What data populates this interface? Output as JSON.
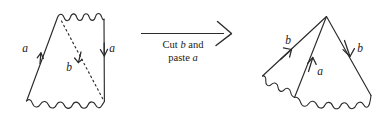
{
  "diagram": {
    "stroke_color": "#2b2b2b",
    "background_color": "#ffffff",
    "transform": {
      "caption_line_1_prefix": "Cut ",
      "caption_line_1_symbol": "b",
      "caption_line_1_suffix": " and",
      "caption_line_2_prefix": "paste ",
      "caption_line_2_symbol": "a",
      "caption_line_2_suffix": "",
      "arrow_direction": "right"
    },
    "left_figure": {
      "name": "quadrilateral-before-cut",
      "labels": [
        {
          "id": "left-a",
          "text": "a",
          "x": 27,
          "y": 52,
          "edge": "left-edge",
          "arrow": "up"
        },
        {
          "id": "right-a",
          "text": "a",
          "x": 111,
          "y": 52,
          "edge": "right-edge",
          "arrow": "down"
        },
        {
          "id": "diagonal-b",
          "text": "b",
          "x": 68,
          "y": 70,
          "edge": "dashed-diagonal",
          "arrow": "down-right"
        }
      ],
      "edges": [
        {
          "id": "top-edge",
          "style": "wavy"
        },
        {
          "id": "left-edge",
          "style": "solid",
          "label": "a",
          "orientation": "up"
        },
        {
          "id": "right-edge",
          "style": "solid",
          "label": "a",
          "orientation": "down"
        },
        {
          "id": "bottom-edge",
          "style": "wavy"
        },
        {
          "id": "dashed-diagonal",
          "style": "dashed",
          "label": "b",
          "orientation": "down"
        }
      ]
    },
    "right_figure": {
      "name": "cone-after-paste",
      "labels": [
        {
          "id": "left-b",
          "text": "b",
          "x": 288,
          "y": 41,
          "edge": "left-edge",
          "arrow": "up-right"
        },
        {
          "id": "middle-a",
          "text": "a",
          "x": 320,
          "y": 70,
          "edge": "middle-edge",
          "arrow": "up"
        },
        {
          "id": "right-b",
          "text": "b",
          "x": 359,
          "y": 52,
          "edge": "right-edge",
          "arrow": "down"
        }
      ],
      "edges": [
        {
          "id": "left-edge",
          "style": "solid",
          "label": "b",
          "orientation": "up-right"
        },
        {
          "id": "middle-edge",
          "style": "solid",
          "label": "a",
          "orientation": "up"
        },
        {
          "id": "right-edge",
          "style": "solid",
          "label": "b",
          "orientation": "down"
        },
        {
          "id": "left-bottom-edge",
          "style": "wavy"
        },
        {
          "id": "bottom-edge",
          "style": "wavy"
        }
      ]
    }
  }
}
